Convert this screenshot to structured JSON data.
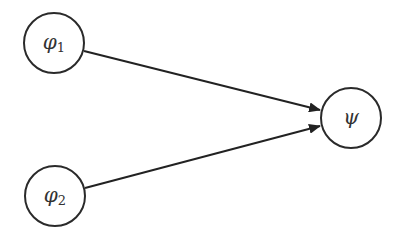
{
  "diagram": {
    "nodes": [
      {
        "id": "phi1",
        "symbol": "φ",
        "subscript": "1",
        "cx": 54,
        "cy": 43,
        "r": 30
      },
      {
        "id": "phi2",
        "symbol": "φ",
        "subscript": "2",
        "cx": 55,
        "cy": 196,
        "r": 30
      },
      {
        "id": "psi",
        "symbol": "ψ",
        "subscript": "",
        "cx": 351,
        "cy": 118,
        "r": 30
      }
    ],
    "edges": [
      {
        "from": "phi1",
        "to": "psi"
      },
      {
        "from": "phi2",
        "to": "psi"
      }
    ],
    "colors": {
      "stroke": "#2a2a2a",
      "text": "#333333",
      "background": "#ffffff"
    }
  }
}
